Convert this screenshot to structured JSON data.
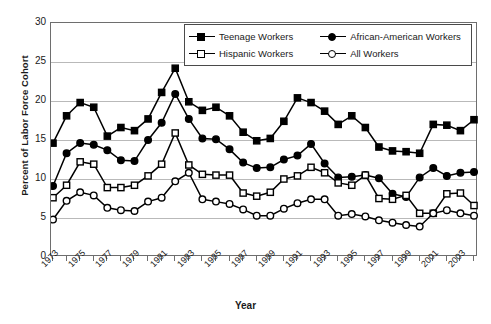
{
  "chart_data": {
    "type": "line",
    "title": "",
    "xlabel": "Year",
    "ylabel": "Percent of Labor Force Cohort",
    "xlim": [
      1973,
      2004
    ],
    "ylim": [
      0,
      30
    ],
    "yticks": [
      0,
      5,
      10,
      15,
      20,
      25,
      30
    ],
    "grid": "horizontal",
    "legend_position": "top-right-inside",
    "x": [
      1973,
      1974,
      1975,
      1976,
      1977,
      1978,
      1979,
      1980,
      1981,
      1982,
      1983,
      1984,
      1985,
      1986,
      1987,
      1988,
      1989,
      1990,
      1991,
      1992,
      1993,
      1994,
      1995,
      1996,
      1997,
      1998,
      1999,
      2000,
      2001,
      2002,
      2003,
      2004
    ],
    "xtick_labels": [
      "1973",
      "",
      "1975",
      "",
      "1977",
      "",
      "1979",
      "",
      "1981",
      "",
      "1983",
      "",
      "1985",
      "",
      "1987",
      "",
      "1989",
      "",
      "1991",
      "",
      "1993",
      "",
      "1995",
      "",
      "1997",
      "",
      "1999",
      "",
      "2001",
      "",
      "2003",
      ""
    ],
    "series": [
      {
        "name": "Teenage Workers",
        "marker": "filled-square",
        "values": [
          14.6,
          18.1,
          19.8,
          19.2,
          15.5,
          16.6,
          16.2,
          17.7,
          21.1,
          24.2,
          19.9,
          18.8,
          19.2,
          18.1,
          16.0,
          14.9,
          15.2,
          17.4,
          20.4,
          19.8,
          18.7,
          17.0,
          18.1,
          16.6,
          14.1,
          13.6,
          13.5,
          13.3,
          17.0,
          16.9,
          16.2,
          17.6
        ]
      },
      {
        "name": "African-American Workers",
        "marker": "filled-circle",
        "values": [
          9.1,
          13.3,
          14.6,
          14.4,
          13.7,
          12.4,
          12.3,
          15.0,
          17.2,
          20.9,
          17.7,
          15.2,
          15.1,
          13.8,
          12.1,
          11.4,
          11.5,
          12.5,
          13.0,
          14.5,
          12.0,
          10.2,
          10.3,
          10.5,
          10.1,
          8.1,
          7.7,
          10.2,
          11.4,
          10.4,
          10.8,
          10.9
        ]
      },
      {
        "name": "Hispanic Workers",
        "marker": "open-square",
        "values": [
          7.6,
          9.2,
          12.2,
          11.9,
          8.9,
          8.9,
          9.2,
          10.4,
          11.9,
          15.9,
          11.8,
          10.6,
          10.5,
          10.5,
          8.2,
          7.8,
          8.3,
          10.0,
          10.4,
          11.5,
          10.8,
          9.5,
          9.2,
          10.5,
          7.5,
          7.4,
          7.9,
          5.6,
          5.6,
          8.1,
          8.2,
          6.6
        ]
      },
      {
        "name": "All Workers",
        "marker": "open-circle",
        "values": [
          4.8,
          7.2,
          8.3,
          7.9,
          6.3,
          6.0,
          5.9,
          7.1,
          7.6,
          9.7,
          10.8,
          7.4,
          7.1,
          6.8,
          6.1,
          5.3,
          5.3,
          6.2,
          6.9,
          7.4,
          7.4,
          5.3,
          5.5,
          5.2,
          4.7,
          4.4,
          4.1,
          3.9,
          5.6,
          6.0,
          5.6,
          5.3
        ]
      }
    ]
  },
  "legend": {
    "entries": [
      {
        "label": "Teenage Workers",
        "marker": "filled-square"
      },
      {
        "label": "African-American Workers",
        "marker": "filled-circle"
      },
      {
        "label": "Hispanic Workers",
        "marker": "open-square"
      },
      {
        "label": "All Workers",
        "marker": "open-circle"
      }
    ]
  },
  "axes": {
    "y_title": "Percent of Labor Force Cohort",
    "x_title": "Year"
  },
  "colors": {
    "line": "#000000",
    "grid": "#b9b9b9",
    "frame": "#6e6e6e",
    "background": "#ffffff"
  }
}
